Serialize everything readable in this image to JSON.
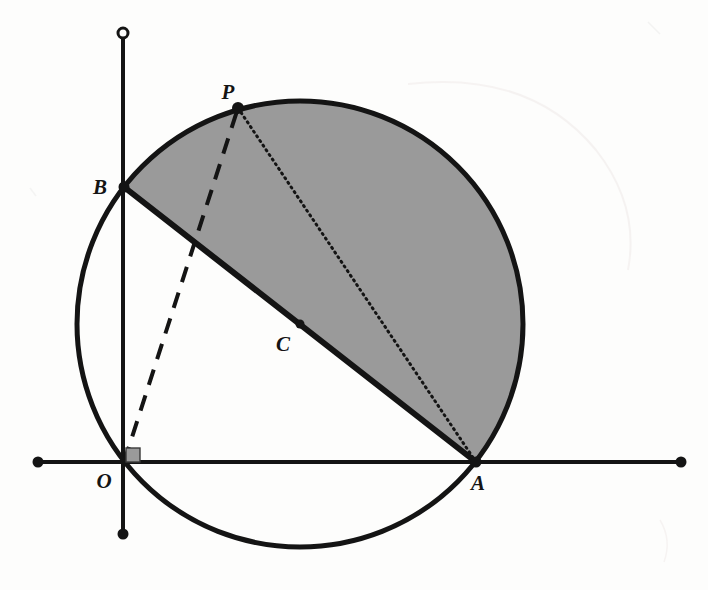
{
  "figure": {
    "type": "euclidean-geometry-diagram",
    "background_color": "#fdfdfc",
    "stroke_color": "#141414",
    "shaded_region_color": "#9a9a9a",
    "canvas": {
      "width": 708,
      "height": 590
    }
  },
  "labels": {
    "origin": "O",
    "point_a": "A",
    "point_b": "B",
    "point_c": "C",
    "point_p": "P"
  },
  "geometry": {
    "circle": {
      "name": "main-circle",
      "center_x": 300,
      "center_y": 324,
      "radius": 223,
      "stroke_width": 5
    },
    "points": [
      {
        "id": "O",
        "label": "O",
        "x": 124,
        "y": 462,
        "label_x": 104,
        "label_y": 488,
        "marker": "none"
      },
      {
        "id": "A",
        "label": "A",
        "x": 476,
        "y": 462,
        "label_x": 478,
        "label_y": 490,
        "marker": "dot"
      },
      {
        "id": "B",
        "label": "B",
        "x": 124,
        "y": 187,
        "label_x": 100,
        "label_y": 194,
        "marker": "dot"
      },
      {
        "id": "C",
        "label": "C",
        "x": 300,
        "y": 324,
        "label_x": 283,
        "label_y": 351,
        "marker": "dot"
      },
      {
        "id": "P",
        "label": "P",
        "x": 238,
        "y": 108,
        "label_x": 228,
        "label_y": 99,
        "marker": "dot"
      }
    ],
    "axes": {
      "x_axis": {
        "name": "x-axis",
        "x1": 38,
        "y1": 462,
        "x2": 681,
        "y2": 462,
        "stroke_width": 4
      },
      "y_axis": {
        "name": "y-axis",
        "x1": 123,
        "y1": 33,
        "x2": 123,
        "y2": 534,
        "stroke_width": 4
      },
      "endpoints": [
        {
          "id": "x-left-endpoint",
          "x": 38,
          "y": 462,
          "style": "filled"
        },
        {
          "id": "x-right-endpoint",
          "x": 681,
          "y": 462,
          "style": "filled"
        },
        {
          "id": "y-top-endpoint",
          "x": 123,
          "y": 33,
          "style": "hollow"
        },
        {
          "id": "y-bottom-endpoint",
          "x": 123,
          "y": 534,
          "style": "filled"
        }
      ]
    },
    "segments": [
      {
        "id": "chord-BA",
        "from": "B",
        "to": "A",
        "style": "solid",
        "stroke_width": 6,
        "x1": 124,
        "y1": 187,
        "x2": 476,
        "y2": 462
      },
      {
        "id": "segment-OP",
        "from": "O",
        "to": "P",
        "style": "dashed",
        "stroke_width": 4,
        "x1": 124,
        "y1": 462,
        "x2": 238,
        "y2": 108
      },
      {
        "id": "segment-PA",
        "from": "P",
        "to": "A",
        "style": "dotted",
        "stroke_width": 3,
        "x1": 238,
        "y1": 108,
        "x2": 476,
        "y2": 462
      }
    ],
    "right_angle_marker": {
      "id": "right-angle-at-O",
      "at": "O",
      "x": 126,
      "y": 448,
      "size": 14,
      "fill": "#9a9a9a"
    },
    "shaded_segment": {
      "id": "circular-segment-BPA",
      "description": "Major circular segment bounded by chord BA and the arc through P",
      "path": "M 124 187 A 223 223 0 1 1 476 462 Z"
    }
  }
}
